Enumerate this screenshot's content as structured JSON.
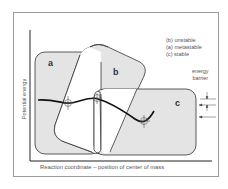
{
  "legend": {
    "items": [
      "(b)  unstable",
      "(a)  metastable",
      "(c)  stable"
    ]
  },
  "axes": {
    "ylabel": "Potential energy",
    "xlabel": "Reaction coordinate – position of center of mass"
  },
  "annotation": {
    "line1": "energy",
    "line2": "barrier"
  },
  "regions": {
    "a": "a",
    "b": "b",
    "c": "c"
  },
  "colors": {
    "region_fill": "#e4e4e4",
    "stroke": "#222222",
    "text": "#555555"
  }
}
